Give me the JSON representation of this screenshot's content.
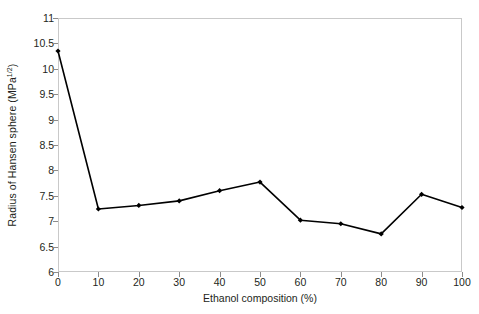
{
  "chart_data": {
    "type": "line",
    "title": "",
    "xlabel": "Ethanol composition (%)",
    "ylabel": "Radius of Hansen sphere (MPa",
    "ylabel_superscript": "1/2",
    "ylabel_suffix": ")",
    "x": [
      0,
      10,
      20,
      30,
      40,
      50,
      60,
      70,
      80,
      90,
      100
    ],
    "values": [
      10.35,
      7.24,
      7.31,
      7.4,
      7.6,
      7.77,
      7.02,
      6.95,
      6.75,
      7.53,
      7.27
    ],
    "series": [
      {
        "name": "Radius of Hansen sphere",
        "values": [
          10.35,
          7.24,
          7.31,
          7.4,
          7.6,
          7.77,
          7.02,
          6.95,
          6.75,
          7.53,
          7.27
        ]
      }
    ],
    "xlim": [
      0,
      100
    ],
    "ylim": [
      6,
      11
    ],
    "xticks": [
      "0",
      "10",
      "20",
      "30",
      "40",
      "50",
      "60",
      "70",
      "80",
      "90",
      "100"
    ],
    "yticks": [
      "6",
      "6.5",
      "7",
      "7.5",
      "8",
      "8.5",
      "9",
      "9.5",
      "10",
      "10.5",
      "11"
    ],
    "ytick_values": [
      6,
      6.5,
      7,
      7.5,
      8,
      8.5,
      9,
      9.5,
      10,
      10.5,
      11
    ],
    "xtick_values": [
      0,
      10,
      20,
      30,
      40,
      50,
      60,
      70,
      80,
      90,
      100
    ],
    "grid": false,
    "legend": false,
    "legend_position": "none",
    "line_color": "#000000",
    "marker": "diamond",
    "marker_color": "#000000",
    "frame_color": "#c9c9c9",
    "background_color": "#ffffff"
  }
}
